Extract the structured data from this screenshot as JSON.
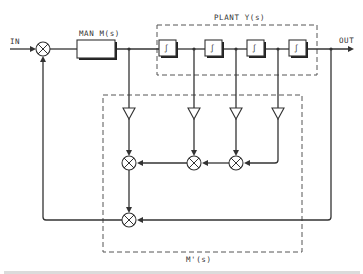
{
  "diagram": {
    "type": "control-system-block-diagram",
    "labels": {
      "input": "IN",
      "output": "OUT",
      "controller": "MAN M(s)",
      "plant": "PLANT Y(s)",
      "model": "M'(s)",
      "integrator_symbol": "∫"
    },
    "blocks": [
      {
        "id": "summing-junction-input",
        "kind": "multiplier"
      },
      {
        "id": "man-block",
        "kind": "block",
        "label_ref": "controller"
      },
      {
        "id": "integrator-1",
        "kind": "integrator"
      },
      {
        "id": "integrator-2",
        "kind": "integrator"
      },
      {
        "id": "integrator-3",
        "kind": "integrator"
      },
      {
        "id": "integrator-4",
        "kind": "integrator"
      },
      {
        "id": "gain-1",
        "kind": "gain-triangle"
      },
      {
        "id": "gain-2",
        "kind": "gain-triangle"
      },
      {
        "id": "gain-3",
        "kind": "gain-triangle"
      },
      {
        "id": "gain-4",
        "kind": "gain-triangle"
      },
      {
        "id": "multiplier-1",
        "kind": "multiplier"
      },
      {
        "id": "multiplier-2",
        "kind": "multiplier"
      },
      {
        "id": "multiplier-3",
        "kind": "multiplier"
      },
      {
        "id": "multiplier-4",
        "kind": "multiplier"
      }
    ],
    "groups": [
      {
        "id": "plant-group",
        "label_ref": "plant",
        "contains": [
          "integrator-1",
          "integrator-2",
          "integrator-3",
          "integrator-4"
        ]
      },
      {
        "id": "model-group",
        "label_ref": "model",
        "contains": [
          "gain-1",
          "gain-2",
          "gain-3",
          "gain-4",
          "multiplier-1",
          "multiplier-2",
          "multiplier-3",
          "multiplier-4"
        ]
      }
    ]
  }
}
